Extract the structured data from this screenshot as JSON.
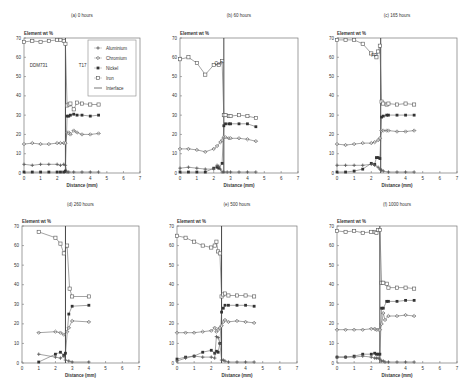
{
  "figure": {
    "legend": {
      "items": [
        {
          "name": "Aluminium",
          "marker": "plus"
        },
        {
          "name": "Chromium",
          "marker": "diamond-open"
        },
        {
          "name": "Nickel",
          "marker": "square-filled"
        },
        {
          "name": "Iron",
          "marker": "square-open"
        },
        {
          "name": "Interface",
          "marker": "line"
        }
      ]
    }
  },
  "chart_data": [
    {
      "type": "line",
      "panel": "a",
      "title": "(a)  0 hours",
      "ylabel": "Element wt %",
      "xlabel": "Distance (mm)",
      "xlim": [
        0,
        7
      ],
      "ylim": [
        0,
        70
      ],
      "xticks": [
        0,
        1,
        2,
        3,
        4,
        5,
        6,
        7
      ],
      "yticks": [
        0,
        10,
        20,
        30,
        40,
        50,
        60,
        70
      ],
      "annotations": [
        {
          "text": "DDM731",
          "x": 0.35,
          "y": 55
        },
        {
          "text": "T17",
          "x": 3.3,
          "y": 55
        }
      ],
      "interface_x": 2.5,
      "grid": false,
      "legend_position": "upper right",
      "series": [
        {
          "name": "Iron",
          "x": [
            0,
            0.5,
            1,
            1.5,
            2,
            2.2,
            2.4,
            2.5,
            2.6,
            2.7,
            2.8,
            3,
            3.2,
            3.5,
            4,
            4.5
          ],
          "y": [
            68,
            68.5,
            68,
            68.5,
            69,
            69,
            68.5,
            67,
            35,
            35.5,
            36,
            33,
            36.5,
            36,
            35.5,
            35.5
          ]
        },
        {
          "name": "Nickel",
          "x": [
            2.5,
            2.6,
            2.7,
            2.8,
            3,
            3.2,
            3.5,
            4,
            4.5
          ],
          "y": [
            1,
            29.5,
            29.5,
            30,
            30.5,
            30,
            30,
            29.5,
            30
          ]
        },
        {
          "name": "Chromium",
          "x": [
            0,
            0.5,
            1,
            1.5,
            2,
            2.2,
            2.4,
            2.5,
            2.6,
            2.7,
            2.8,
            3,
            3.2,
            3.5,
            4,
            4.5
          ],
          "y": [
            15,
            15.5,
            15,
            15,
            15.5,
            15.5,
            15.5,
            15.5,
            21,
            21,
            20,
            22,
            21,
            20,
            20,
            20.5
          ]
        },
        {
          "name": "Aluminium",
          "x": [
            0,
            0.5,
            1,
            1.5,
            2,
            2.2,
            2.4,
            2.5,
            2.6,
            2.7,
            3,
            3.5,
            4,
            4.5
          ],
          "y": [
            4.5,
            4,
            4.5,
            4.5,
            4.5,
            4,
            4.5,
            4,
            0.5,
            0.5,
            0.5,
            0.5,
            0.5,
            0.5
          ]
        },
        {
          "name": "Nickel-base",
          "x": [
            0,
            0.5,
            1,
            1.5,
            2,
            2.2,
            2.4
          ],
          "y": [
            0.5,
            0.5,
            0.5,
            0.5,
            0.5,
            0.5,
            0.5
          ]
        }
      ]
    },
    {
      "type": "line",
      "panel": "b",
      "title": "(b)  60 hours",
      "ylabel": "Element wt %",
      "xlabel": "Distance (mm)",
      "xlim": [
        0,
        7
      ],
      "ylim": [
        0,
        70
      ],
      "xticks": [
        0,
        1,
        2,
        3,
        4,
        5,
        6,
        7
      ],
      "yticks": [
        0,
        10,
        20,
        30,
        40,
        50,
        60,
        70
      ],
      "annotations": [
        {
          "text": "Ox?",
          "x": 2.05,
          "y": 56
        }
      ],
      "interface_x": 2.6,
      "grid": false,
      "series": [
        {
          "name": "Iron",
          "x": [
            0,
            0.5,
            1,
            1.5,
            2,
            2.3,
            2.5,
            2.6,
            2.7,
            2.9,
            3,
            3.5,
            4,
            4.5
          ],
          "y": [
            59,
            60,
            57,
            51,
            56,
            56,
            58,
            30,
            30,
            29.5,
            29.5,
            30,
            29.5,
            28.5
          ]
        },
        {
          "name": "Nickel",
          "x": [
            0,
            0.5,
            1,
            1.5,
            2,
            2.2,
            2.3,
            2.5,
            2.6,
            2.7,
            2.9,
            3,
            3.5,
            4,
            4.5
          ],
          "y": [
            0.5,
            0.5,
            0.5,
            0.5,
            2.5,
            3,
            2.5,
            5,
            24.5,
            25.5,
            25.5,
            25.5,
            25.5,
            25.5,
            24
          ]
        },
        {
          "name": "Chromium",
          "x": [
            0,
            0.5,
            1,
            1.5,
            2,
            2.2,
            2.4,
            2.5,
            2.6,
            2.7,
            2.9,
            3,
            3.5,
            4,
            4.5
          ],
          "y": [
            12.5,
            12.5,
            12,
            11,
            12.5,
            14,
            16,
            17,
            18.5,
            18.5,
            18,
            18,
            18,
            17.5,
            16.5
          ]
        },
        {
          "name": "Aluminium",
          "x": [
            0,
            0.5,
            1,
            1.5,
            2,
            2.2,
            2.3,
            2.4,
            2.5,
            2.6,
            2.8,
            3,
            3.5,
            4,
            4.5
          ],
          "y": [
            2.5,
            3,
            2.5,
            2,
            2,
            4,
            3.5,
            2,
            0.5,
            0.5,
            0.5,
            0.5,
            0.5,
            0.5,
            0.5
          ]
        }
      ]
    },
    {
      "type": "line",
      "panel": "c",
      "title": "(c)  165 hours",
      "ylabel": "Element wt %",
      "xlabel": "Distance (mm)",
      "xlim": [
        0,
        7
      ],
      "ylim": [
        0,
        70
      ],
      "xticks": [
        0,
        1,
        2,
        3,
        4,
        5,
        6,
        7
      ],
      "yticks": [
        0,
        10,
        20,
        30,
        40,
        50,
        60,
        70
      ],
      "annotations": [
        {
          "text": "FP",
          "x": 2.0,
          "y": 60
        }
      ],
      "interface_x": 2.55,
      "grid": false,
      "series": [
        {
          "name": "Iron",
          "x": [
            0,
            0.5,
            1,
            1.5,
            2,
            2.3,
            2.4,
            2.5,
            2.6,
            2.7,
            2.9,
            3,
            3.5,
            4,
            4.5
          ],
          "y": [
            69,
            69,
            69,
            67,
            62,
            60,
            63,
            66,
            37,
            36,
            35.5,
            36,
            35.5,
            36,
            35.5
          ]
        },
        {
          "name": "Nickel",
          "x": [
            0,
            0.5,
            1,
            1.5,
            2,
            2.2,
            2.3,
            2.4,
            2.5,
            2.6,
            2.7,
            2.9,
            3,
            3.5,
            4,
            4.5
          ],
          "y": [
            0.5,
            0.5,
            1,
            2,
            5,
            4.5,
            8,
            8,
            7.5,
            29,
            29.5,
            30,
            30,
            30,
            30,
            30
          ]
        },
        {
          "name": "Chromium",
          "x": [
            0,
            0.5,
            1,
            1.5,
            2,
            2.2,
            2.4,
            2.5,
            2.6,
            2.7,
            2.9,
            3,
            3.5,
            4,
            4.5
          ],
          "y": [
            15,
            14.5,
            15,
            15.5,
            15.5,
            16,
            17,
            18,
            22,
            22,
            22,
            22,
            21.5,
            21.5,
            22
          ]
        },
        {
          "name": "Aluminium",
          "x": [
            0,
            0.5,
            1,
            1.5,
            2,
            2.2,
            2.4,
            2.5,
            2.6,
            2.7,
            3,
            3.5,
            4,
            4.5
          ],
          "y": [
            4,
            4,
            4,
            4,
            4.5,
            4,
            3,
            2,
            1.5,
            1,
            0.5,
            0.5,
            0.5,
            0.5
          ]
        }
      ]
    },
    {
      "type": "line",
      "panel": "d",
      "title": "(d)  260 hours",
      "ylabel": "Element wt %",
      "xlabel": "Distance (mm)",
      "xlim": [
        0,
        7
      ],
      "ylim": [
        0,
        70
      ],
      "xticks": [
        0,
        1,
        2,
        3,
        4,
        5,
        6,
        7
      ],
      "yticks": [
        0,
        10,
        20,
        30,
        40,
        50,
        60,
        70
      ],
      "annotations": [],
      "interface_x": 2.6,
      "grid": false,
      "series": [
        {
          "name": "Iron",
          "x": [
            1,
            2,
            2.3,
            2.5,
            2.7,
            2.85,
            3,
            4
          ],
          "y": [
            67,
            64,
            61,
            56,
            60,
            38,
            34,
            34
          ]
        },
        {
          "name": "Nickel",
          "x": [
            1,
            2,
            2.3,
            2.5,
            2.6,
            2.8,
            3,
            4
          ],
          "y": [
            0.5,
            4.5,
            5.5,
            4,
            5,
            25,
            29,
            29.5
          ]
        },
        {
          "name": "Chromium",
          "x": [
            1,
            2,
            2.3,
            2.5,
            2.7,
            2.8,
            3,
            4
          ],
          "y": [
            15.5,
            16,
            15.5,
            14.5,
            16,
            18,
            21.5,
            21
          ]
        },
        {
          "name": "Aluminium",
          "x": [
            1,
            2,
            2.3,
            2.5,
            2.6,
            2.8,
            3,
            4
          ],
          "y": [
            4.5,
            3,
            2.5,
            3.5,
            1.5,
            1,
            0.5,
            0.5
          ]
        }
      ]
    },
    {
      "type": "line",
      "panel": "e",
      "title": "(e)  500 hours",
      "ylabel": "Element wt %",
      "xlabel": "Distance (mm)",
      "xlim": [
        0,
        7
      ],
      "ylim": [
        0,
        70
      ],
      "xticks": [
        0,
        1,
        2,
        3,
        4,
        5,
        6,
        7
      ],
      "yticks": [
        0,
        10,
        20,
        30,
        40,
        50,
        60,
        70
      ],
      "annotations": [],
      "interface_x": 2.6,
      "grid": false,
      "series": [
        {
          "name": "Iron",
          "x": [
            0,
            0.5,
            1,
            1.5,
            2,
            2.2,
            2.3,
            2.4,
            2.5,
            2.6,
            2.7,
            2.8,
            3,
            3.5,
            4,
            4.5
          ],
          "y": [
            65,
            64,
            62,
            60,
            59,
            60,
            62,
            57,
            56,
            34,
            35,
            35.5,
            34.5,
            34.5,
            34.5,
            34
          ]
        },
        {
          "name": "Nickel",
          "x": [
            0,
            0.5,
            1,
            1.5,
            2,
            2.2,
            2.3,
            2.4,
            2.5,
            2.6,
            2.7,
            2.8,
            3,
            3.5,
            4,
            4.5
          ],
          "y": [
            2,
            3,
            3.5,
            5.5,
            6.5,
            5,
            6,
            5.5,
            10,
            26,
            28,
            29.5,
            29.5,
            29.5,
            29.5,
            29
          ]
        },
        {
          "name": "Chromium",
          "x": [
            0,
            0.5,
            1,
            1.5,
            2,
            2.2,
            2.3,
            2.4,
            2.5,
            2.6,
            2.7,
            2.8,
            3,
            3.5,
            4,
            4.5
          ],
          "y": [
            15.5,
            15.5,
            15.5,
            16,
            16.5,
            18,
            16,
            17,
            18,
            19,
            21,
            22,
            21,
            21.5,
            21,
            20.5
          ]
        },
        {
          "name": "Aluminium",
          "x": [
            0,
            0.5,
            1,
            1.5,
            2,
            2.2,
            2.3,
            2.4,
            2.5,
            2.6,
            2.7,
            2.8,
            3,
            3.5,
            4,
            4.5
          ],
          "y": [
            1,
            2.5,
            3.5,
            3,
            3,
            2.5,
            13.5,
            13,
            10,
            1.5,
            1.5,
            1,
            0.5,
            0.5,
            0.5,
            0.5
          ]
        }
      ]
    },
    {
      "type": "line",
      "panel": "f",
      "title": "(f)  1000 hours",
      "ylabel": "Element wt %",
      "xlabel": "Distance (mm)",
      "xlim": [
        0,
        7
      ],
      "ylim": [
        0,
        70
      ],
      "xticks": [
        0,
        1,
        2,
        3,
        4,
        5,
        6,
        7
      ],
      "yticks": [
        0,
        10,
        20,
        30,
        40,
        50,
        60,
        70
      ],
      "annotations": [],
      "interface_x": 2.5,
      "grid": false,
      "series": [
        {
          "name": "Iron",
          "x": [
            0,
            0.5,
            1,
            1.5,
            2,
            2.2,
            2.3,
            2.4,
            2.5,
            2.6,
            2.7,
            2.9,
            3,
            3.5,
            4,
            4.5
          ],
          "y": [
            67.5,
            67,
            67.5,
            66.5,
            67,
            67,
            66.5,
            68,
            68,
            41,
            41,
            40.5,
            38.5,
            38.5,
            38.5,
            38
          ]
        },
        {
          "name": "Nickel",
          "x": [
            0,
            0.5,
            1,
            1.5,
            2,
            2.2,
            2.3,
            2.4,
            2.5,
            2.6,
            2.7,
            2.9,
            3,
            3.5,
            4,
            4.5
          ],
          "y": [
            3,
            3,
            3.5,
            4.5,
            4.5,
            5,
            4.5,
            4.5,
            4.5,
            28,
            28,
            31.5,
            31.5,
            31.5,
            32,
            32
          ]
        },
        {
          "name": "Chromium",
          "x": [
            0,
            0.5,
            1,
            1.5,
            2,
            2.2,
            2.3,
            2.4,
            2.5,
            2.6,
            2.7,
            2.8,
            3,
            3.5,
            4,
            4.5
          ],
          "y": [
            17,
            17,
            17,
            17,
            17.5,
            17.5,
            17,
            17,
            17,
            20,
            25.5,
            22,
            24,
            24,
            24.5,
            24
          ]
        },
        {
          "name": "Aluminium",
          "x": [
            0,
            0.5,
            1,
            1.5,
            2,
            2.2,
            2.3,
            2.4,
            2.5,
            2.6,
            2.7,
            2.8,
            3,
            3.5,
            4,
            4.5
          ],
          "y": [
            3,
            3,
            3,
            3.5,
            3,
            2.5,
            2.5,
            2.5,
            2,
            1,
            1,
            0.5,
            0.5,
            0.5,
            0.5,
            0.5
          ]
        }
      ]
    }
  ]
}
